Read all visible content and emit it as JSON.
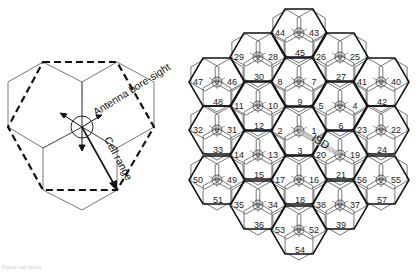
{
  "left_diagram": {
    "title": "Single site, three-sector layout",
    "labels": {
      "boresight": "Antenna bore-sight",
      "cell_range": "Cell range"
    }
  },
  "right_diagram": {
    "title": "19-site, 57-cell hexagonal layout",
    "isd_label": "ISD",
    "sites": [
      {
        "x": 299,
        "y": 33,
        "left": "44",
        "right": "43",
        "bottom": "45"
      },
      {
        "x": 258,
        "y": 57,
        "left": "29",
        "right": "28",
        "bottom": "30"
      },
      {
        "x": 340,
        "y": 57,
        "left": "26",
        "right": "25",
        "bottom": "27"
      },
      {
        "x": 217,
        "y": 82,
        "left": "47",
        "right": "46",
        "bottom": "48"
      },
      {
        "x": 299,
        "y": 82,
        "left": "8",
        "right": "7",
        "bottom": "9"
      },
      {
        "x": 381,
        "y": 82,
        "left": "41",
        "right": "40",
        "bottom": "42"
      },
      {
        "x": 258,
        "y": 106,
        "left": "11",
        "right": "10",
        "bottom": "12"
      },
      {
        "x": 340,
        "y": 106,
        "left": "5",
        "right": "4",
        "bottom": "6"
      },
      {
        "x": 217,
        "y": 130,
        "left": "32",
        "right": "31",
        "bottom": "33"
      },
      {
        "x": 299,
        "y": 131,
        "left": "2",
        "right": "1",
        "bottom": "3"
      },
      {
        "x": 381,
        "y": 130,
        "left": "23",
        "right": "22",
        "bottom": "24"
      },
      {
        "x": 258,
        "y": 155,
        "left": "14",
        "right": "13",
        "bottom": "15"
      },
      {
        "x": 340,
        "y": 155,
        "left": "20",
        "right": "19",
        "bottom": "21"
      },
      {
        "x": 217,
        "y": 180,
        "left": "50",
        "right": "49",
        "bottom": "51"
      },
      {
        "x": 299,
        "y": 180,
        "left": "17",
        "right": "16",
        "bottom": "18"
      },
      {
        "x": 381,
        "y": 180,
        "left": "56",
        "right": "55",
        "bottom": "57"
      },
      {
        "x": 258,
        "y": 205,
        "left": "35",
        "right": "34",
        "bottom": "36"
      },
      {
        "x": 340,
        "y": 205,
        "left": "38",
        "right": "37",
        "bottom": "39"
      },
      {
        "x": 299,
        "y": 230,
        "left": "53",
        "right": "52",
        "bottom": "54"
      }
    ]
  },
  "caption": "Figure: cell layout"
}
